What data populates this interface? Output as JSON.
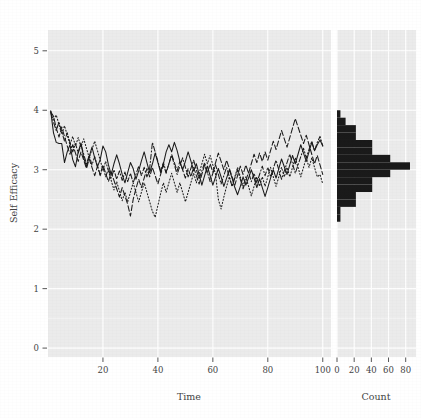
{
  "figure": {
    "name": "self-efficacy-trajectories",
    "background_color": "#ffffff",
    "panel_color": "#ebebeb",
    "grid_color": "#ffffff",
    "ink_color": "#1a1a1a",
    "text_color": "#444444"
  },
  "axes": {
    "y_label": "Self Efficacy",
    "y_ticks": [
      "0",
      "1",
      "2",
      "3",
      "4",
      "5"
    ],
    "y_values": [
      0,
      1,
      2,
      3,
      4,
      5
    ],
    "y_min": -0.15,
    "y_max": 5.35,
    "panels": [
      {
        "key": "time",
        "x_label": "Time",
        "x_ticks": [
          "20",
          "40",
          "60",
          "80",
          "100"
        ],
        "x_values": [
          20,
          40,
          60,
          80,
          100
        ],
        "x_min": 0,
        "x_max": 103
      },
      {
        "key": "count",
        "x_label": "Count",
        "x_ticks": [
          "0",
          "20",
          "40",
          "60",
          "80"
        ],
        "x_values": [
          0,
          20,
          40,
          60,
          80
        ],
        "x_min": 0,
        "x_max": 92
      }
    ]
  },
  "chart_data": {
    "type": "line",
    "title": "",
    "xlabel": "Time",
    "ylabel": "Self Efficacy",
    "xlim": [
      0,
      103
    ],
    "ylim": [
      -0.15,
      5.35
    ],
    "grid": true,
    "legend": "none",
    "x": [
      1,
      2,
      3,
      4,
      5,
      6,
      7,
      8,
      9,
      10,
      11,
      12,
      13,
      14,
      15,
      16,
      17,
      18,
      19,
      20,
      21,
      22,
      23,
      24,
      25,
      26,
      27,
      28,
      29,
      30,
      31,
      32,
      33,
      34,
      35,
      36,
      37,
      38,
      39,
      40,
      41,
      42,
      43,
      44,
      45,
      46,
      47,
      48,
      49,
      50,
      51,
      52,
      53,
      54,
      55,
      56,
      57,
      58,
      59,
      60,
      61,
      62,
      63,
      64,
      65,
      66,
      67,
      68,
      69,
      70,
      71,
      72,
      73,
      74,
      75,
      76,
      77,
      78,
      79,
      80,
      81,
      82,
      83,
      84,
      85,
      86,
      87,
      88,
      89,
      90,
      91,
      92,
      93,
      94,
      95,
      96,
      97,
      98,
      99,
      100
    ],
    "series": [
      {
        "name": "series-1",
        "style": "solid",
        "values": [
          3.98,
          3.62,
          3.46,
          3.44,
          3.44,
          3.12,
          3.3,
          3.42,
          3.17,
          3.05,
          3.3,
          3.45,
          3.2,
          3.05,
          3.22,
          3.38,
          3.2,
          3.05,
          3.17,
          3.4,
          3.3,
          3.08,
          2.92,
          3.1,
          3.25,
          3.1,
          2.92,
          2.78,
          2.95,
          3.12,
          3.02,
          2.84,
          2.98,
          3.15,
          3.3,
          3.12,
          2.95,
          3.1,
          3.28,
          3.12,
          2.95,
          3.1,
          3.3,
          3.42,
          3.3,
          3.46,
          3.32,
          3.14,
          3.0,
          3.14,
          3.3,
          3.15,
          2.98,
          3.1,
          2.92,
          2.74,
          2.9,
          3.06,
          2.9,
          2.74,
          2.88,
          3.02,
          2.88,
          2.72,
          2.86,
          3.0,
          2.86,
          2.7,
          2.58,
          2.72,
          2.88,
          2.74,
          2.86,
          3.0,
          2.86,
          2.7,
          2.85,
          2.7,
          2.55,
          2.7,
          2.86,
          3.0,
          2.86,
          3.02,
          3.18,
          3.05,
          2.92,
          3.08,
          3.24,
          3.1,
          3.26,
          3.42,
          3.28,
          3.14,
          3.3,
          3.46,
          3.32,
          3.42,
          3.5,
          3.4
        ]
      },
      {
        "name": "series-2",
        "style": "dashed",
        "values": [
          3.97,
          3.9,
          3.7,
          3.55,
          3.72,
          3.56,
          3.4,
          3.26,
          3.42,
          3.28,
          3.14,
          3.3,
          3.16,
          3.02,
          3.18,
          3.04,
          2.9,
          3.06,
          2.92,
          3.08,
          2.94,
          2.8,
          2.96,
          2.82,
          2.68,
          2.54,
          2.7,
          2.56,
          2.42,
          2.22,
          2.5,
          2.68,
          2.84,
          2.7,
          2.86,
          3.02,
          2.88,
          3.04,
          2.9,
          2.76,
          2.92,
          3.08,
          2.94,
          3.1,
          3.26,
          3.12,
          2.98,
          3.14,
          3.0,
          2.86,
          3.02,
          2.88,
          3.04,
          2.9,
          2.76,
          2.92,
          3.08,
          2.94,
          3.1,
          2.96,
          3.12,
          3.28,
          3.14,
          3.0,
          3.16,
          3.02,
          2.88,
          2.74,
          2.9,
          3.06,
          2.92,
          3.08,
          2.94,
          3.1,
          3.26,
          3.12,
          3.28,
          3.14,
          3.3,
          3.16,
          3.32,
          3.48,
          3.34,
          3.5,
          3.66,
          3.52,
          3.38,
          3.54,
          3.7,
          3.86,
          3.72,
          3.58,
          3.44,
          3.58,
          3.42,
          3.26,
          3.1,
          3.24,
          3.08,
          2.92
        ]
      },
      {
        "name": "series-3",
        "style": "dotted",
        "values": [
          3.99,
          3.84,
          3.92,
          3.76,
          3.6,
          3.74,
          3.58,
          3.42,
          3.56,
          3.4,
          3.54,
          3.38,
          3.52,
          3.36,
          3.2,
          3.34,
          3.48,
          3.32,
          3.16,
          3.0,
          3.14,
          2.98,
          2.82,
          2.66,
          2.8,
          2.64,
          2.48,
          2.62,
          2.46,
          2.62,
          2.78,
          2.62,
          2.46,
          2.62,
          2.78,
          2.62,
          2.46,
          2.3,
          2.2,
          2.4,
          2.6,
          2.78,
          2.62,
          2.78,
          2.94,
          2.78,
          2.62,
          2.78,
          2.62,
          2.46,
          2.62,
          2.78,
          2.94,
          2.78,
          2.94,
          3.1,
          3.26,
          3.1,
          3.24,
          3.08,
          2.92,
          2.5,
          2.34,
          2.54,
          2.72,
          2.88,
          2.72,
          2.88,
          3.04,
          2.88,
          2.72,
          2.88,
          2.72,
          2.56,
          2.72,
          2.88,
          2.72,
          2.88,
          2.72,
          2.88,
          3.04,
          2.88,
          2.72,
          2.88,
          3.04,
          2.88,
          3.04,
          2.88,
          3.04,
          3.2,
          3.04,
          2.88,
          3.04,
          3.2,
          3.04,
          3.2,
          3.04,
          2.88,
          2.92,
          2.76
        ]
      },
      {
        "name": "series-4",
        "style": "dashdot",
        "values": [
          3.96,
          3.8,
          3.66,
          3.8,
          3.64,
          3.48,
          3.62,
          3.46,
          3.3,
          3.44,
          3.28,
          3.42,
          3.26,
          3.1,
          3.24,
          3.08,
          3.22,
          3.06,
          2.9,
          3.04,
          2.88,
          3.02,
          2.86,
          3.0,
          2.84,
          2.98,
          2.82,
          2.96,
          2.8,
          2.94,
          2.78,
          2.92,
          3.06,
          2.9,
          3.04,
          2.88,
          3.02,
          3.46,
          3.3,
          3.14,
          2.98,
          3.12,
          2.96,
          3.1,
          3.24,
          3.08,
          2.92,
          3.06,
          3.2,
          3.04,
          2.88,
          3.02,
          3.16,
          3.0,
          2.84,
          2.98,
          3.12,
          2.96,
          2.8,
          2.94,
          3.08,
          2.92,
          2.76,
          2.9,
          3.04,
          2.88,
          2.72,
          2.86,
          3.0,
          2.84,
          2.68,
          2.82,
          2.96,
          2.8,
          2.94,
          2.78,
          2.92,
          3.06,
          2.9,
          3.04,
          2.88,
          3.02,
          3.16,
          3.0,
          2.84,
          2.98,
          3.12,
          3.26,
          3.1,
          2.94,
          3.08,
          3.22,
          3.36,
          3.2,
          3.34,
          3.48,
          3.32,
          3.46,
          3.56,
          3.4
        ]
      }
    ],
    "histogram": {
      "type": "bar",
      "orientation": "horizontal",
      "xlabel": "Count",
      "ylabel": "Self Efficacy",
      "xlim": [
        0,
        92
      ],
      "bin_width": 0.125,
      "bin_centers": [
        2.1875,
        2.3125,
        2.4375,
        2.5625,
        2.6875,
        2.8125,
        2.9375,
        3.0625,
        3.1875,
        3.3125,
        3.4375,
        3.5625,
        3.6875,
        3.8125,
        3.9375
      ],
      "counts": [
        4,
        4,
        22,
        22,
        41,
        41,
        62,
        85,
        62,
        41,
        41,
        22,
        22,
        10,
        4
      ]
    }
  }
}
